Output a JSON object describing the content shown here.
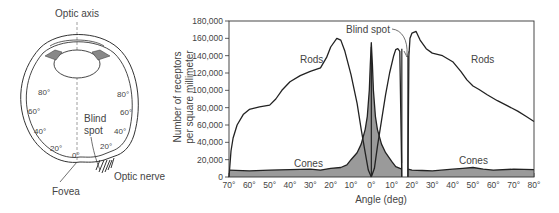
{
  "eye_diagram": {
    "optic_axis_label": "Optic axis",
    "blind_spot_label_line1": "Blind",
    "blind_spot_label_line2": "spot",
    "fovea_label": "Fovea",
    "optic_nerve_label": "Optic nerve",
    "angle_marks_left": [
      "80°",
      "60°",
      "40°",
      "20°"
    ],
    "angle_marks_right": [
      "80°",
      "60°",
      "40°",
      "20°"
    ],
    "center_mark": "0°"
  },
  "chart_data": {
    "type": "area",
    "title": "",
    "xlabel": "Angle (deg)",
    "ylabel": "Number of receptors per square millimeter",
    "ylabel_line1": "Number of receptors",
    "ylabel_line2": "per square millimeter",
    "xlim": [
      -70,
      80
    ],
    "ylim": [
      0,
      180000
    ],
    "grid": false,
    "x_tick_labels": [
      "70°",
      "60°",
      "50°",
      "40°",
      "30°",
      "20°",
      "10°",
      "0°",
      "10°",
      "20°",
      "30°",
      "40°",
      "50°",
      "60°",
      "70°",
      "80°"
    ],
    "x_ticks": [
      -70,
      -60,
      -50,
      -40,
      -30,
      -20,
      -10,
      0,
      10,
      20,
      30,
      40,
      50,
      60,
      70,
      80
    ],
    "y_tick_labels": [
      "0",
      "20,000",
      "40,000",
      "60,000",
      "80,000",
      "100,000",
      "120,000",
      "140,000",
      "160,000",
      "180,000"
    ],
    "y_ticks": [
      0,
      20000,
      40000,
      60000,
      80000,
      100000,
      120000,
      140000,
      160000,
      180000
    ],
    "annotations": [
      "Rods",
      "Rods",
      "Cones",
      "Cones",
      "Blind spot"
    ],
    "blind_spot_range": [
      15,
      18
    ],
    "series": [
      {
        "name": "Rods",
        "segments": [
          {
            "x": [
              -70,
              -69,
              -68,
              -66,
              -63,
              -60,
              -55,
              -50,
              -47,
              -44,
              -40,
              -35,
              -30,
              -25,
              -22,
              -20,
              -17,
              -15,
              -13,
              -10,
              -7,
              -5,
              -3,
              -1.5,
              0
            ],
            "y": [
              0,
              30000,
              45000,
              60000,
              72000,
              78000,
              81000,
              83000,
              90000,
              100000,
              110000,
              117000,
              122000,
              126000,
              138000,
              150000,
              160000,
              158000,
              145000,
              118000,
              85000,
              55000,
              28000,
              8000,
              0
            ]
          },
          {
            "x": [
              0,
              1.5,
              3,
              5,
              7,
              9,
              11,
              12,
              13,
              14,
              15
            ],
            "y": [
              0,
              10000,
              35000,
              65000,
              95000,
              120000,
              140000,
              147000,
              148000,
              145000,
              0
            ]
          },
          {
            "x": [
              18,
              18.5,
              19,
              20,
              22,
              24,
              27,
              30,
              35,
              40,
              44,
              47,
              50,
              53,
              57,
              62,
              67,
              72,
              76,
              80
            ],
            "y": [
              0,
              140000,
              160000,
              166000,
              168000,
              158000,
              148000,
              143000,
              140000,
              133000,
              122000,
              112000,
              105000,
              101000,
              95000,
              88000,
              82000,
              76000,
              70000,
              64000
            ]
          }
        ]
      },
      {
        "name": "Cones",
        "segments": [
          {
            "x": [
              -70,
              -60,
              -50,
              -40,
              -30,
              -25,
              -20,
              -15,
              -12,
              -10,
              -7,
              -5,
              -3,
              -2,
              -1,
              -0.5,
              0,
              0.5,
              1,
              2,
              3,
              5,
              7,
              10,
              12,
              15
            ],
            "y": [
              8000,
              7000,
              8000,
              8500,
              9000,
              8000,
              10000,
              11000,
              14000,
              20000,
              28000,
              38000,
              55000,
              70000,
              100000,
              130000,
              155000,
              130000,
              100000,
              70000,
              55000,
              38000,
              28000,
              18000,
              12000,
              9000
            ]
          },
          {
            "x": [
              18,
              20,
              25,
              30,
              40,
              45,
              50,
              55,
              60,
              70,
              80
            ],
            "y": [
              9000,
              8000,
              7500,
              7000,
              9000,
              10000,
              11000,
              9000,
              8000,
              9000,
              8500
            ]
          }
        ]
      }
    ]
  }
}
